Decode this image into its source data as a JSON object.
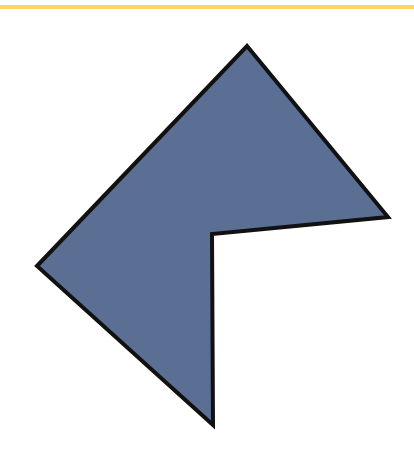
{
  "figure": {
    "shape": "concave-pentagon",
    "fill_color": "#5b6e94",
    "stroke_color": "#111111",
    "stroke_width": 4,
    "vertices": [
      [
        247,
        46
      ],
      [
        388,
        217
      ],
      [
        212,
        234
      ],
      [
        213,
        425
      ],
      [
        37,
        266
      ]
    ]
  },
  "decoration": {
    "top_rule_color": "#fdd36a"
  }
}
